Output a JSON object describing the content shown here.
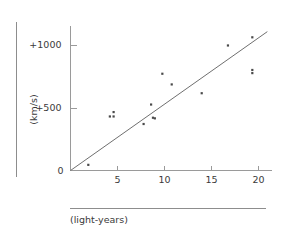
{
  "figure": {
    "name": "hubble-velocity-distance-diagram"
  },
  "chart_data": {
    "type": "scatter",
    "title": "",
    "xlabel": "(light-years)",
    "ylabel": "(km/s)",
    "xlim": [
      0,
      21.5
    ],
    "ylim": [
      0,
      1150
    ],
    "grid": false,
    "legend": null,
    "x_ticks": [
      5,
      10,
      15,
      20
    ],
    "x_tick_labels": [
      "5",
      "10",
      "15",
      "20"
    ],
    "y_ticks": [
      0,
      500,
      1000
    ],
    "y_tick_labels": [
      "0",
      "+500",
      "+1000"
    ],
    "origin_label": "0",
    "points": [
      {
        "x": 1.9,
        "y": 45
      },
      {
        "x": 4.2,
        "y": 430
      },
      {
        "x": 4.6,
        "y": 465
      },
      {
        "x": 4.6,
        "y": 430
      },
      {
        "x": 7.8,
        "y": 370
      },
      {
        "x": 8.6,
        "y": 525
      },
      {
        "x": 8.8,
        "y": 420
      },
      {
        "x": 9.0,
        "y": 415
      },
      {
        "x": 9.8,
        "y": 770
      },
      {
        "x": 10.8,
        "y": 685
      },
      {
        "x": 14.0,
        "y": 615
      },
      {
        "x": 16.8,
        "y": 995
      },
      {
        "x": 19.4,
        "y": 1060
      },
      {
        "x": 19.4,
        "y": 800
      },
      {
        "x": 19.4,
        "y": 775
      }
    ],
    "trend_line": {
      "label": "",
      "x0": 0,
      "y0": 0,
      "x1": 21.0,
      "y1": 1105
    }
  }
}
